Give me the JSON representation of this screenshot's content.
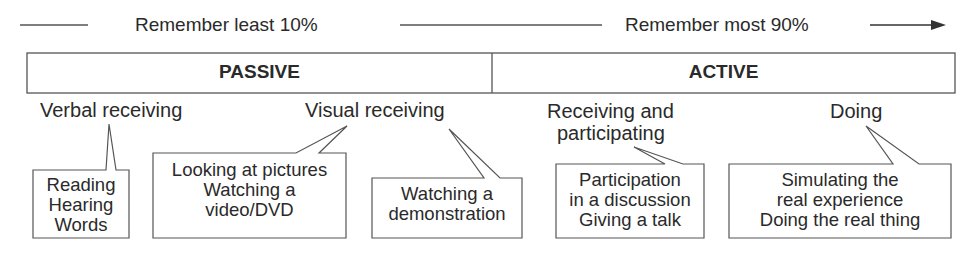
{
  "header": {
    "left_text": "Remember least 10%",
    "right_text": "Remember most 90%",
    "arrow_icon": "arrow-right-icon"
  },
  "categories": {
    "passive": "PASSIVE",
    "active": "ACTIVE"
  },
  "labels": {
    "verbal": "Verbal receiving",
    "visual": "Visual receiving",
    "receiving_participating_1": "Receiving and",
    "receiving_participating_2": "participating",
    "doing": "Doing"
  },
  "callouts": {
    "verbal": [
      "Reading",
      "Hearing",
      "Words"
    ],
    "visual_pictures": [
      "Looking at pictures",
      "Watching a",
      "video/DVD"
    ],
    "visual_demo": [
      "Watching a",
      "demonstration"
    ],
    "participating": [
      "Participation",
      "in a discussion",
      "Giving a talk"
    ],
    "doing": [
      "Simulating the",
      "real experience",
      "Doing the real thing"
    ]
  },
  "colors": {
    "stroke": "#555555",
    "text": "#2a2a2a",
    "background": "#ffffff"
  }
}
